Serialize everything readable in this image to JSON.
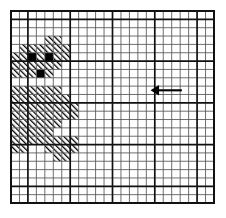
{
  "figure": {
    "name": "grid-density-map",
    "colors": {
      "background": "#ffffff",
      "grid_minor": "#555555",
      "grid_major": "#111111",
      "frame": "#111111",
      "cell_solid": "#000000",
      "cell_hatch": "#000000",
      "arrow": "#000000"
    }
  },
  "chart_data": {
    "type": "heatmap",
    "title": "",
    "subtitle": "",
    "xlabel": "",
    "ylabel": "",
    "grid": true,
    "legend_position": "none",
    "plot_box": {
      "x": 11,
      "y": 11,
      "width": 203,
      "height": 192
    },
    "columns": 24,
    "rows": 23,
    "cell_width": 8.458,
    "cell_height": 8.348,
    "major_every": 5,
    "major_col_offset": 2,
    "major_row_offset": 1,
    "xlim": [
      0,
      24
    ],
    "ylim": [
      0,
      23
    ],
    "x_ticks": [],
    "y_ticks": [],
    "levels": [
      {
        "key": "empty",
        "label": "empty",
        "fill": "none"
      },
      {
        "key": "hatch",
        "label": "hatched",
        "fill": "diagonal-hatch"
      },
      {
        "key": "solid",
        "label": "solid",
        "fill": "#000000"
      }
    ],
    "solid_cells": [
      {
        "col": 2,
        "row": 5
      },
      {
        "col": 4,
        "row": 5
      },
      {
        "col": 3,
        "row": 7
      }
    ],
    "hatch_cells": [
      {
        "col": 4,
        "row": 3
      },
      {
        "col": 5,
        "row": 3
      },
      {
        "col": 1,
        "row": 4
      },
      {
        "col": 2,
        "row": 4
      },
      {
        "col": 3,
        "row": 4
      },
      {
        "col": 4,
        "row": 4
      },
      {
        "col": 5,
        "row": 4
      },
      {
        "col": 6,
        "row": 4
      },
      {
        "col": 0,
        "row": 5
      },
      {
        "col": 1,
        "row": 5
      },
      {
        "col": 3,
        "row": 5
      },
      {
        "col": 5,
        "row": 5
      },
      {
        "col": 6,
        "row": 5
      },
      {
        "col": 0,
        "row": 6
      },
      {
        "col": 1,
        "row": 6
      },
      {
        "col": 2,
        "row": 6
      },
      {
        "col": 3,
        "row": 6
      },
      {
        "col": 4,
        "row": 6
      },
      {
        "col": 5,
        "row": 6
      },
      {
        "col": 0,
        "row": 7
      },
      {
        "col": 1,
        "row": 7
      },
      {
        "col": 2,
        "row": 7
      },
      {
        "col": 4,
        "row": 7
      },
      {
        "col": 0,
        "row": 9
      },
      {
        "col": 1,
        "row": 9
      },
      {
        "col": 2,
        "row": 9
      },
      {
        "col": 3,
        "row": 9
      },
      {
        "col": 4,
        "row": 9
      },
      {
        "col": 5,
        "row": 9
      },
      {
        "col": 0,
        "row": 10
      },
      {
        "col": 1,
        "row": 10
      },
      {
        "col": 2,
        "row": 10
      },
      {
        "col": 3,
        "row": 10
      },
      {
        "col": 4,
        "row": 10
      },
      {
        "col": 5,
        "row": 10
      },
      {
        "col": 6,
        "row": 10
      },
      {
        "col": 0,
        "row": 11
      },
      {
        "col": 1,
        "row": 11
      },
      {
        "col": 2,
        "row": 11
      },
      {
        "col": 3,
        "row": 11
      },
      {
        "col": 4,
        "row": 11
      },
      {
        "col": 5,
        "row": 11
      },
      {
        "col": 6,
        "row": 11
      },
      {
        "col": 7,
        "row": 11
      },
      {
        "col": 0,
        "row": 12
      },
      {
        "col": 1,
        "row": 12
      },
      {
        "col": 2,
        "row": 12
      },
      {
        "col": 3,
        "row": 12
      },
      {
        "col": 4,
        "row": 12
      },
      {
        "col": 5,
        "row": 12
      },
      {
        "col": 6,
        "row": 12
      },
      {
        "col": 7,
        "row": 12
      },
      {
        "col": 0,
        "row": 13
      },
      {
        "col": 1,
        "row": 13
      },
      {
        "col": 2,
        "row": 13
      },
      {
        "col": 3,
        "row": 13
      },
      {
        "col": 4,
        "row": 13
      },
      {
        "col": 5,
        "row": 13
      },
      {
        "col": 0,
        "row": 14
      },
      {
        "col": 1,
        "row": 14
      },
      {
        "col": 2,
        "row": 14
      },
      {
        "col": 3,
        "row": 14
      },
      {
        "col": 4,
        "row": 14
      },
      {
        "col": 0,
        "row": 15
      },
      {
        "col": 1,
        "row": 15
      },
      {
        "col": 2,
        "row": 15
      },
      {
        "col": 3,
        "row": 15
      },
      {
        "col": 4,
        "row": 15
      },
      {
        "col": 5,
        "row": 15
      },
      {
        "col": 6,
        "row": 15
      },
      {
        "col": 7,
        "row": 15
      },
      {
        "col": 0,
        "row": 16
      },
      {
        "col": 1,
        "row": 16
      },
      {
        "col": 4,
        "row": 16
      },
      {
        "col": 5,
        "row": 16
      },
      {
        "col": 6,
        "row": 16
      },
      {
        "col": 7,
        "row": 16
      },
      {
        "col": 5,
        "row": 17
      },
      {
        "col": 6,
        "row": 17
      }
    ]
  },
  "annotations": {
    "arrow": {
      "name": "left-pointing-arrow",
      "direction": "left",
      "tail_col": 20.2,
      "head_col": 16.5,
      "row": 9.5,
      "label": ""
    }
  }
}
